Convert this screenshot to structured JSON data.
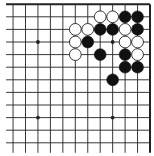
{
  "diagram": {
    "game": "Go",
    "board_size": 19,
    "visible_region": "top-right corner",
    "visible_columns": [
      "H",
      "J",
      "K",
      "L",
      "M",
      "N",
      "O",
      "P",
      "Q",
      "R",
      "S",
      "T"
    ],
    "visible_rows": [
      19,
      18,
      17,
      16,
      15,
      14,
      13,
      12,
      11,
      10,
      9,
      8
    ],
    "edges_shown": [
      "top",
      "right"
    ],
    "colors": {
      "background": "#ffffff",
      "line": "#222222",
      "black_stone": "#111111",
      "white_stone": "#ffffff",
      "white_stone_outline": "#222222"
    },
    "star_points": [
      "Q16",
      "K16",
      "Q10",
      "K10"
    ],
    "stones": [
      {
        "color": "white",
        "point": "P18"
      },
      {
        "color": "white",
        "point": "Q18"
      },
      {
        "color": "black",
        "point": "R18"
      },
      {
        "color": "black",
        "point": "S18"
      },
      {
        "color": "white",
        "point": "N17"
      },
      {
        "color": "white",
        "point": "O17"
      },
      {
        "color": "black",
        "point": "P17"
      },
      {
        "color": "black",
        "point": "Q17"
      },
      {
        "color": "white",
        "point": "R17"
      },
      {
        "color": "black",
        "point": "S17"
      },
      {
        "color": "white",
        "point": "N16"
      },
      {
        "color": "black",
        "point": "O16"
      },
      {
        "color": "white",
        "point": "R16"
      },
      {
        "color": "white",
        "point": "S16"
      },
      {
        "color": "white",
        "point": "N15"
      },
      {
        "color": "black",
        "point": "P15"
      },
      {
        "color": "black",
        "point": "R15"
      },
      {
        "color": "white",
        "point": "S15"
      },
      {
        "color": "black",
        "point": "R14"
      },
      {
        "color": "black",
        "point": "S14"
      },
      {
        "color": "black",
        "point": "Q13"
      }
    ]
  }
}
